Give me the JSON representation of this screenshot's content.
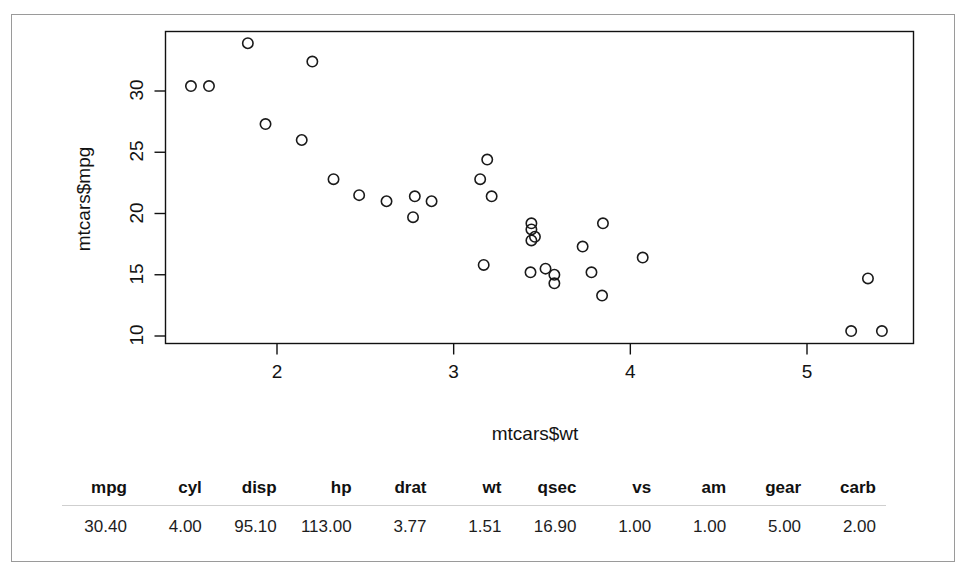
{
  "plot": {
    "x_axis_label": "mtcars$wt",
    "y_axis_label": "mtcars$mpg",
    "x_ticks": [
      "2",
      "3",
      "4",
      "5"
    ],
    "y_ticks": [
      "10",
      "15",
      "20",
      "25",
      "30"
    ]
  },
  "table": {
    "headers": [
      "mpg",
      "cyl",
      "disp",
      "hp",
      "drat",
      "wt",
      "qsec",
      "vs",
      "am",
      "gear",
      "carb"
    ],
    "rows": [
      [
        "30.40",
        "4.00",
        "95.10",
        "113.00",
        "3.77",
        "1.51",
        "16.90",
        "1.00",
        "1.00",
        "5.00",
        "2.00"
      ]
    ]
  },
  "colors": {
    "point_stroke": "#1a1a1a",
    "axis": "#111111",
    "page_border": "#9a9a9a",
    "table_rule": "#cfcfcf",
    "background": "#ffffff"
  },
  "chart_data": {
    "type": "scatter",
    "title": "",
    "xlabel": "mtcars$wt",
    "ylabel": "mtcars$mpg",
    "xlim": [
      1.35,
      5.55
    ],
    "ylim": [
      9.2,
      34.6
    ],
    "xticks": [
      2,
      3,
      4,
      5
    ],
    "yticks": [
      10,
      15,
      20,
      25,
      30
    ],
    "grid": false,
    "legend": "none",
    "marker": "open-circle",
    "n_points": 32,
    "series": [
      {
        "name": "mtcars",
        "x": [
          2.62,
          2.875,
          2.32,
          3.215,
          3.44,
          3.46,
          3.57,
          3.19,
          3.15,
          3.44,
          3.44,
          4.07,
          3.73,
          3.78,
          5.25,
          5.424,
          5.345,
          2.2,
          1.615,
          1.835,
          2.465,
          3.52,
          3.435,
          3.84,
          3.845,
          1.935,
          2.14,
          1.513,
          3.17,
          2.77,
          3.57,
          2.78
        ],
        "y": [
          21.0,
          21.0,
          22.8,
          21.4,
          18.7,
          18.1,
          14.3,
          24.4,
          22.8,
          19.2,
          17.8,
          16.4,
          17.3,
          15.2,
          10.4,
          10.4,
          14.7,
          32.4,
          30.4,
          33.9,
          21.5,
          15.5,
          15.2,
          13.3,
          19.2,
          27.3,
          26.0,
          30.4,
          15.8,
          19.7,
          15.0,
          21.4
        ]
      }
    ]
  }
}
